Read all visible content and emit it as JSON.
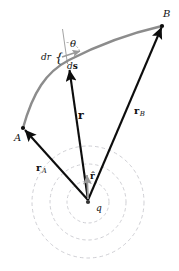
{
  "figure": {
    "canvas": {
      "width": 179,
      "height": 271,
      "background": "#ffffff"
    },
    "colors": {
      "vector_black": "#0d0d0d",
      "path_gray": "#8c8c8c",
      "unit_vector_gray": "#9a9a9a",
      "circle_dashed": "#c9c9cf",
      "thin_line": "#8a8a8a",
      "label_text": "#111111"
    },
    "labels": [
      {
        "id": "point-A",
        "text": "A",
        "style": "italic",
        "x": 14,
        "y": 133,
        "size": 10
      },
      {
        "id": "point-B",
        "text": "B",
        "style": "italic",
        "x": 163,
        "y": 9,
        "size": 10
      },
      {
        "id": "charge-q",
        "text": "q",
        "style": "italic",
        "x": 96,
        "y": 204,
        "size": 9
      },
      {
        "id": "theta",
        "text": "θ",
        "style": "italic",
        "x": 70,
        "y": 39,
        "size": 10
      },
      {
        "id": "dr",
        "text": "dr",
        "style": "italic",
        "x": 41,
        "y": 53,
        "size": 9
      },
      {
        "id": "ds",
        "text": "ds",
        "style": "mixed",
        "x": 67,
        "y": 62,
        "size": 9
      },
      {
        "id": "vector-r",
        "text": "r",
        "style": "bold",
        "x": 78,
        "y": 110,
        "size": 11
      },
      {
        "id": "vector-rA",
        "text": "r",
        "subscript": "A",
        "style": "bold",
        "x": 36,
        "y": 163,
        "size": 10
      },
      {
        "id": "vector-rB",
        "text": "r",
        "subscript": "B",
        "style": "bold",
        "x": 134,
        "y": 106,
        "size": 10
      },
      {
        "id": "unit-vector-r",
        "text": "r̂",
        "style": "bold",
        "x": 90,
        "y": 172,
        "size": 9
      }
    ],
    "geometry": {
      "charge_center": {
        "x": 88,
        "y": 202
      },
      "point_A": {
        "x": 23,
        "y": 128
      },
      "point_B": {
        "x": 162,
        "y": 26
      },
      "point_P": {
        "x": 69,
        "y": 69
      },
      "dashed_circles_radii": [
        21,
        38,
        56
      ],
      "vectors": [
        {
          "id": "r-vector",
          "from": {
            "x": 88,
            "y": 200
          },
          "to": {
            "x": 69,
            "y": 69
          }
        },
        {
          "id": "rA-vector",
          "from": {
            "x": 88,
            "y": 200
          },
          "to": {
            "x": 24,
            "y": 129
          }
        },
        {
          "id": "rB-vector",
          "from": {
            "x": 88,
            "y": 200
          },
          "to": {
            "x": 161,
            "y": 27
          }
        },
        {
          "id": "rhat-vector",
          "from": {
            "x": 88,
            "y": 199
          },
          "to": {
            "x": 87,
            "y": 173
          }
        },
        {
          "id": "ds-vector",
          "from": {
            "x": 64,
            "y": 56
          },
          "to": {
            "x": 84,
            "y": 50
          }
        }
      ],
      "path": {
        "id": "curved-path-A-to-B",
        "description": "gray curved path from A to B",
        "d": "M 23,128 C 33,92 46,72 69,60 C 100,44 136,32 162,26"
      },
      "radial_guide_line": {
        "from": {
          "x": 62,
          "y": 29
        },
        "to": {
          "x": 67,
          "y": 64
        }
      },
      "angle_arc": {
        "cx": 66,
        "cy": 56,
        "r": 15,
        "from_deg": -73,
        "to_deg": -17
      }
    }
  }
}
